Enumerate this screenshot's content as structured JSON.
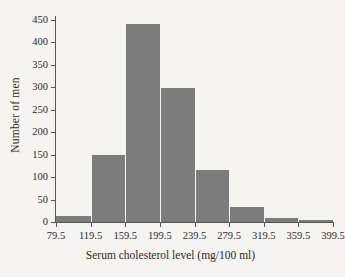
{
  "chart_data": {
    "type": "bar",
    "title": "",
    "xlabel": "Serum cholesterol level  (mg/100 ml)",
    "ylabel": "Number of men",
    "grid": false,
    "legend": "none",
    "bin_edges": [
      79.5,
      119.5,
      159.5,
      199.5,
      239.5,
      279.5,
      319.5,
      359.5,
      399.5
    ],
    "categories": [
      "79.5-119.5",
      "119.5-159.5",
      "159.5-199.5",
      "199.5-239.5",
      "239.5-279.5",
      "279.5-319.5",
      "319.5-359.5",
      "359.5-399.5"
    ],
    "values": [
      13,
      150,
      442,
      299,
      115,
      34,
      9,
      5
    ],
    "xlim": [
      79.5,
      399.5
    ],
    "ylim": [
      0,
      450
    ],
    "xticks": [
      "79.5",
      "119.5",
      "159.5",
      "199.5",
      "239.5",
      "279.5",
      "319.5",
      "359.5",
      "399.5"
    ],
    "yticks": [
      "0",
      "50",
      "100",
      "150",
      "200",
      "250",
      "300",
      "350",
      "400",
      "450"
    ],
    "bar_color": "#7c7c7c",
    "axis_color": "#555555",
    "background_color": "#f6f4f1"
  }
}
